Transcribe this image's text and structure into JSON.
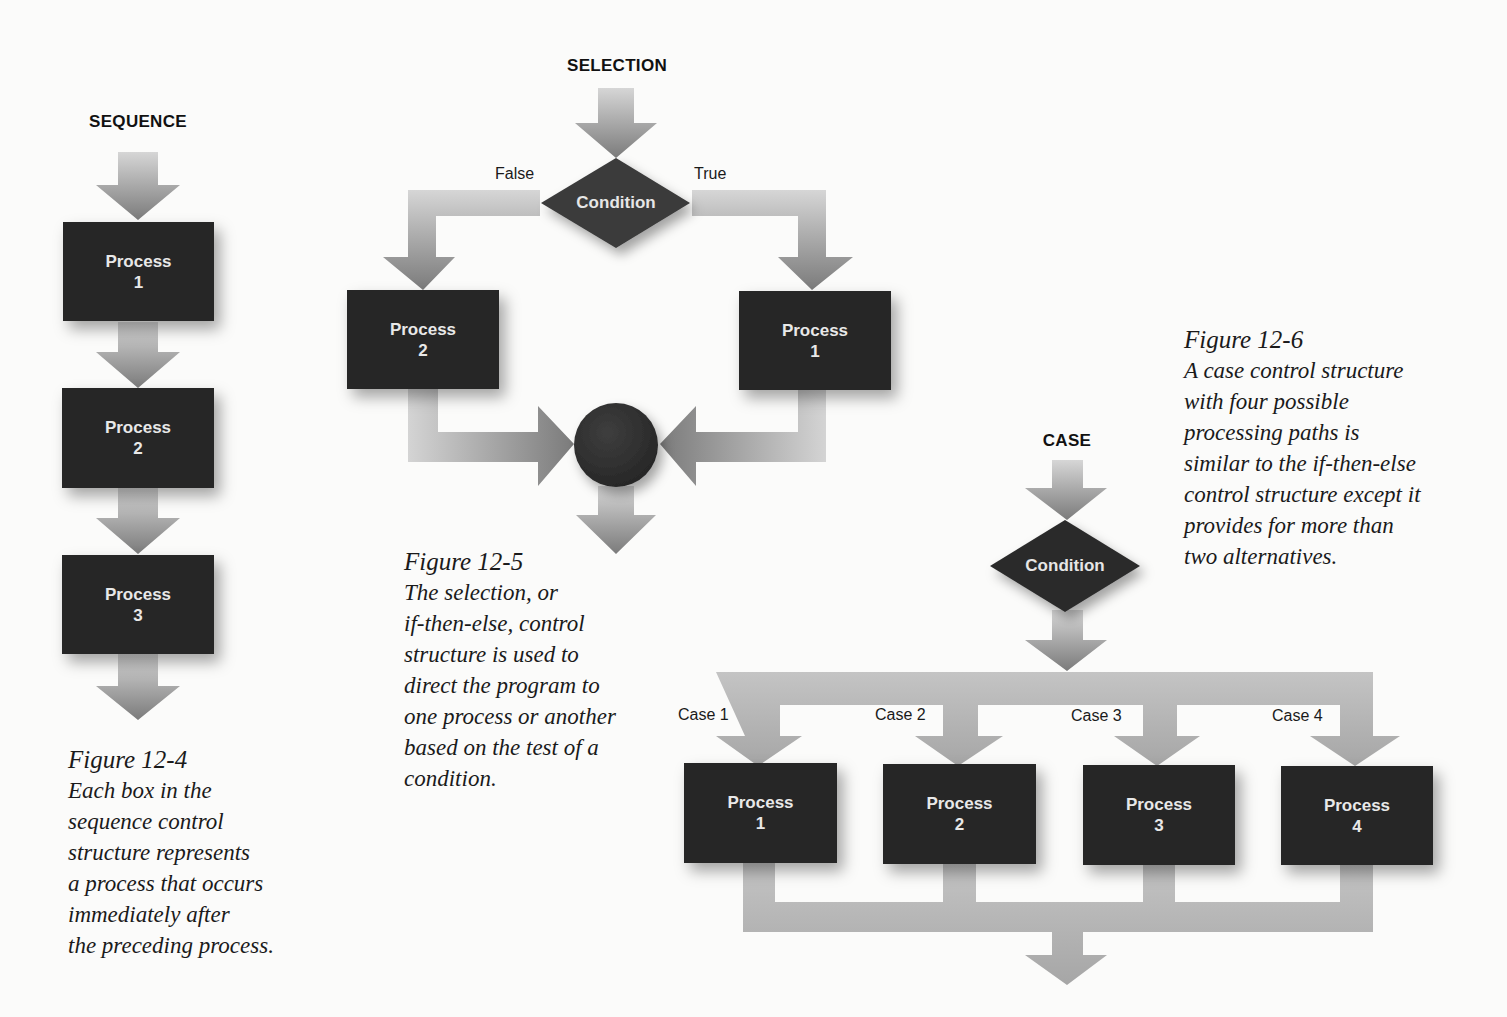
{
  "sequence": {
    "heading": "SEQUENCE",
    "boxes": [
      {
        "label": "Process",
        "num": "1"
      },
      {
        "label": "Process",
        "num": "2"
      },
      {
        "label": "Process",
        "num": "3"
      }
    ],
    "caption": {
      "title": "Figure 12-4",
      "lines": [
        "Each box in the",
        "sequence control",
        "structure represents",
        "a process that occurs",
        "immediately after",
        "the preceding process."
      ]
    }
  },
  "selection": {
    "heading": "SELECTION",
    "condition": "Condition",
    "false_label": "False",
    "true_label": "True",
    "boxes": [
      {
        "label": "Process",
        "num": "2"
      },
      {
        "label": "Process",
        "num": "1"
      }
    ],
    "caption": {
      "title": "Figure 12-5",
      "lines": [
        "The selection, or",
        "if-then-else, control",
        "structure is used to",
        "direct the program to",
        "one process or another",
        "based on the test of a",
        "condition."
      ]
    }
  },
  "case": {
    "heading": "CASE",
    "condition": "Condition",
    "case_labels": [
      "Case 1",
      "Case 2",
      "Case 3",
      "Case 4"
    ],
    "boxes": [
      {
        "label": "Process",
        "num": "1"
      },
      {
        "label": "Process",
        "num": "2"
      },
      {
        "label": "Process",
        "num": "3"
      },
      {
        "label": "Process",
        "num": "4"
      }
    ],
    "caption": {
      "title": "Figure 12-6",
      "lines": [
        "A case control structure",
        "with four possible",
        "processing paths is",
        "similar to the if-then-else",
        "control structure except it",
        "provides for more than",
        "two alternatives."
      ]
    }
  },
  "colors": {
    "box": "#262626",
    "diamond": "#3a3a3a",
    "arrow_light": "#d2d2d2",
    "arrow_dark": "#7a7a7a"
  }
}
